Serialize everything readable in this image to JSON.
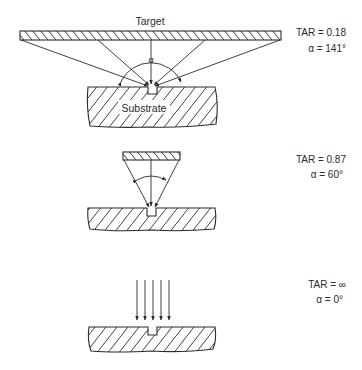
{
  "figure": {
    "panels": [
      {
        "id": "wide-target",
        "target_label": "Target",
        "substrate_label": "Substrate",
        "alpha_symbol": "α",
        "tar_text": "TAR = 0.18",
        "alpha_text": "α = 141°",
        "tar": 0.18,
        "alpha_deg": 141
      },
      {
        "id": "narrow-target",
        "tar_text": "TAR = 0.87",
        "alpha_text": "α = 60°",
        "tar": 0.87,
        "alpha_deg": 60
      },
      {
        "id": "collimated",
        "tar_text": "TAR = ∞",
        "alpha_text": "α = 0°",
        "tar": "∞",
        "alpha_deg": 0
      }
    ]
  }
}
